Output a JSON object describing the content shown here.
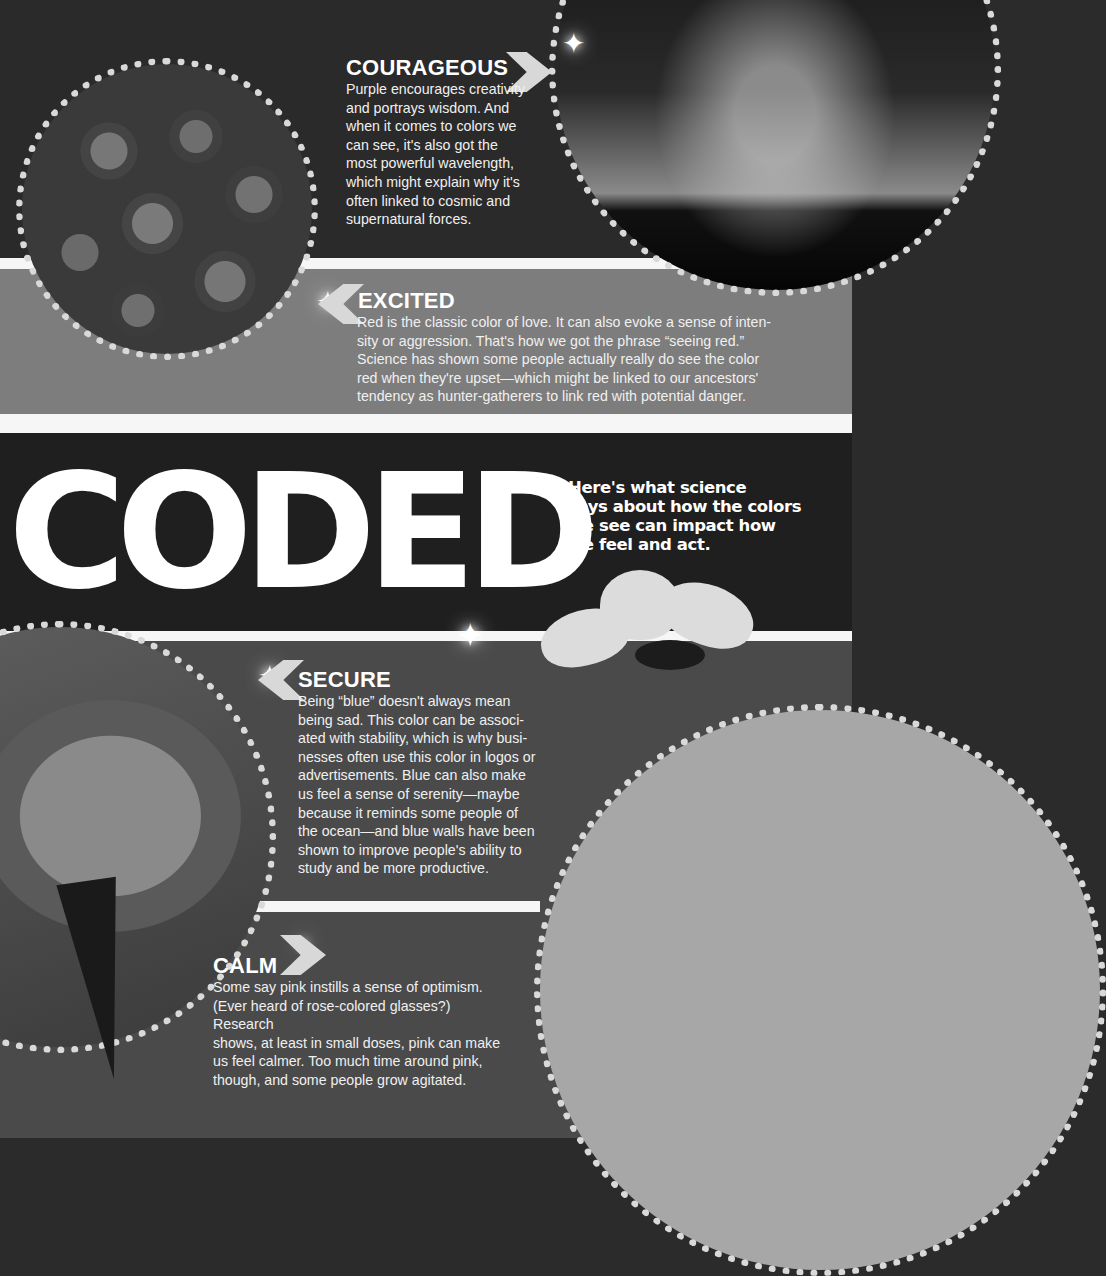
{
  "page": {
    "title": "CODED",
    "subtitle": "Here's what science\nsays about how the colors\nwe see can impact how\nwe feel and act."
  },
  "sections": [
    {
      "id": "courageous",
      "heading": "COURAGEOUS",
      "color": "purple",
      "image": "milky-way-night-sky",
      "arrow": "chevron-right-icon",
      "body": "Purple encourages creativity\nand portrays wisdom. And\nwhen it comes to colors we\ncan see, it's also got the\nmost powerful wavelength,\nwhich might explain why it's\noften linked to cosmic and\nsupernatural forces."
    },
    {
      "id": "excited",
      "heading": "EXCITED",
      "color": "red",
      "image": "bouquet-of-roses",
      "arrow": "chevron-left-icon",
      "body": "Red is the classic color of love. It can also evoke a sense of inten-\nsity or aggression. That's how we got the phrase “seeing red.”\nScience has shown some people actually really do see the color\nred when they're upset—which might be linked to our ancestors'\ntendency as hunter-gatherers to link red with potential danger."
    },
    {
      "id": "secure",
      "heading": "SECURE",
      "color": "blue",
      "image": "ocean-sunfish",
      "arrow": "chevron-left-icon",
      "body": "Being “blue” doesn't always mean\nbeing sad. This color can be associ-\nated with stability, which is why busi-\nnesses often use this color in logos or\nadvertisements. Blue can also make\nus feel a sense of serenity—maybe\nbecause it reminds some people of\nthe ocean—and blue walls have been\nshown to improve people's ability to\nstudy and be more productive."
    },
    {
      "id": "calm",
      "heading": "CALM",
      "color": "pink",
      "image": "cosmos-flowers",
      "arrow": "chevron-right-icon",
      "body": "Some say pink instills a sense of optimism.\n(Ever heard of rose-colored glasses?) Research\nshows, at least in small doses, pink can make\nus feel calmer. Too much time around pink,\nthough, and some people grow agitated."
    }
  ],
  "colors": {
    "top_band": "#2a2a2a",
    "excited_band": "#7d7d7d",
    "title_band": "#1f1f1f",
    "bottom_band": "#4a4a4a",
    "stripe": "#f6f6f6",
    "text": "#ffffff"
  }
}
